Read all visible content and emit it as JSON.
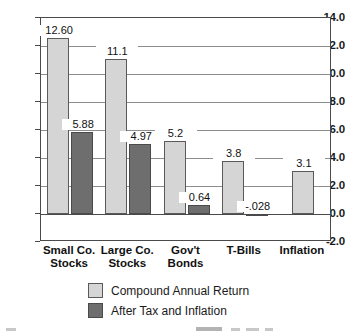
{
  "chart_data": {
    "type": "bar",
    "title": "",
    "xlabel": "",
    "ylabel": "",
    "ylim": [
      -2.0,
      14.0
    ],
    "ytick_step": 2.0,
    "grid": true,
    "legend_position": "bottom",
    "yticks": [
      "14.0",
      "12.0",
      "10.0",
      "8.0",
      "6.0",
      "4.0",
      "2.0",
      "0.0",
      "-2.0"
    ],
    "ytick_values": [
      14.0,
      12.0,
      10.0,
      8.0,
      6.0,
      4.0,
      2.0,
      0.0,
      -2.0
    ],
    "categories": [
      "Small Co.\nStocks",
      "Large Co.\nStocks",
      "Gov't\nBonds",
      "T-Bills",
      "Inflation"
    ],
    "category_lines": [
      [
        "Small Co.",
        "Stocks"
      ],
      [
        "Large Co.",
        "Stocks"
      ],
      [
        "Gov't",
        "Bonds"
      ],
      [
        "T-Bills",
        ""
      ],
      [
        "Inflation",
        ""
      ]
    ],
    "series": [
      {
        "name": "Compound Annual Return",
        "color": "#d5d5d5",
        "values": [
          12.6,
          11.1,
          5.2,
          3.8,
          3.1
        ],
        "labels": [
          "12.60",
          "11.1",
          "5.2",
          "3.8",
          "3.1"
        ]
      },
      {
        "name": "After Tax and Inflation",
        "color": "#6e6e6e",
        "values": [
          5.88,
          4.97,
          0.64,
          -0.028,
          null
        ],
        "labels": [
          "5.88",
          "4.97",
          "0.64",
          "-.028",
          ""
        ]
      }
    ]
  },
  "legend": {
    "items": [
      {
        "label": "Compound Annual Return",
        "color": "#d5d5d5"
      },
      {
        "label": "After Tax and Inflation",
        "color": "#6e6e6e"
      }
    ]
  }
}
